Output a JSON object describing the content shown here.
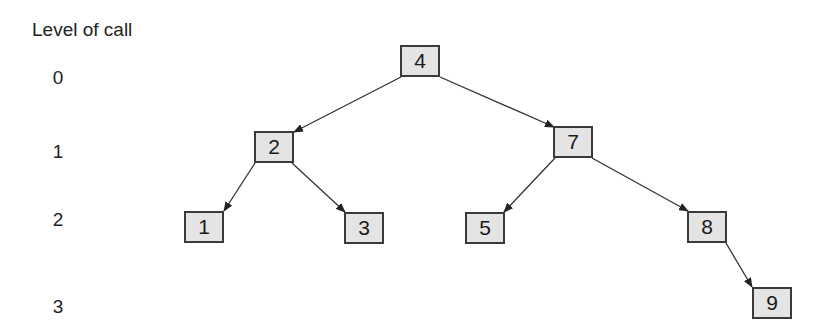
{
  "diagram": {
    "title": "Level of call",
    "levels": [
      "0",
      "1",
      "2",
      "3"
    ],
    "nodes": [
      {
        "id": "n4",
        "label": "4",
        "level": 0
      },
      {
        "id": "n2",
        "label": "2",
        "level": 1
      },
      {
        "id": "n7",
        "label": "7",
        "level": 1
      },
      {
        "id": "n1",
        "label": "1",
        "level": 2
      },
      {
        "id": "n3",
        "label": "3",
        "level": 2
      },
      {
        "id": "n5",
        "label": "5",
        "level": 2
      },
      {
        "id": "n8",
        "label": "8",
        "level": 2
      },
      {
        "id": "n9",
        "label": "9",
        "level": 3
      }
    ],
    "edges": [
      {
        "from": "4",
        "to": "2"
      },
      {
        "from": "4",
        "to": "7"
      },
      {
        "from": "2",
        "to": "1"
      },
      {
        "from": "2",
        "to": "3"
      },
      {
        "from": "7",
        "to": "5"
      },
      {
        "from": "7",
        "to": "8"
      },
      {
        "from": "8",
        "to": "9"
      }
    ],
    "colors": {
      "node_fill": "#e4e4e4",
      "node_border": "#3a3a3a",
      "edge": "#333333"
    }
  }
}
